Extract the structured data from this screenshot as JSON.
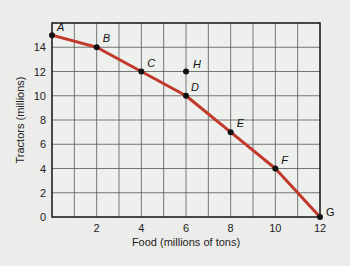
{
  "chart_data": {
    "type": "line",
    "title": "",
    "xlabel": "Food (millions of tons)",
    "ylabel": "Tractors (millions)",
    "xlim": [
      0,
      12
    ],
    "ylim": [
      0,
      16
    ],
    "x_ticks": [
      2,
      4,
      6,
      8,
      10,
      12
    ],
    "y_ticks": [
      0,
      2,
      4,
      6,
      8,
      10,
      12,
      14
    ],
    "grid": true,
    "grid_x_step": 1,
    "grid_y_step": 2,
    "line_color": "#c0392b",
    "series": [
      {
        "name": "Production possibilities frontier",
        "points": [
          {
            "label": "A",
            "x": 0,
            "y": 15
          },
          {
            "label": "B",
            "x": 2,
            "y": 14
          },
          {
            "label": "C",
            "x": 4,
            "y": 12
          },
          {
            "label": "D",
            "x": 6,
            "y": 10
          },
          {
            "label": "E",
            "x": 8,
            "y": 7
          },
          {
            "label": "F",
            "x": 10,
            "y": 4
          },
          {
            "label": "G",
            "x": 12,
            "y": 0
          }
        ]
      }
    ],
    "extra_points": [
      {
        "label": "H",
        "x": 6,
        "y": 12
      }
    ]
  }
}
